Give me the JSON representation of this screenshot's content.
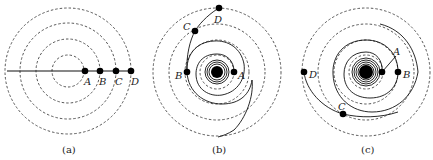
{
  "figure": {
    "panels": [
      {
        "id": "a",
        "caption": "(a)",
        "center": [
          68,
          71
        ],
        "dashed_radii": [
          16,
          32,
          48,
          63
        ],
        "points": [
          {
            "label": "A",
            "x": 85,
            "y": 71
          },
          {
            "label": "B",
            "x": 100,
            "y": 71
          },
          {
            "label": "C",
            "x": 116,
            "y": 71
          },
          {
            "label": "D",
            "x": 131,
            "y": 71
          }
        ]
      },
      {
        "id": "b",
        "caption": "(b)",
        "center": [
          217,
          72
        ],
        "dashed_radii": [
          17,
          32,
          48,
          64
        ],
        "points": [
          {
            "label": "A",
            "x": 234,
            "y": 72
          },
          {
            "label": "B",
            "x": 187,
            "y": 72
          },
          {
            "label": "C",
            "x": 195,
            "y": 31
          },
          {
            "label": "D",
            "x": 219,
            "y": 8
          }
        ]
      },
      {
        "id": "c",
        "caption": "(c)",
        "center": [
          366,
          72
        ],
        "dashed_radii": [
          17,
          32,
          48,
          64
        ],
        "points": [
          {
            "label": "A",
            "x": 382,
            "y": 72
          },
          {
            "label": "B",
            "x": 398,
            "y": 72
          },
          {
            "label": "C",
            "x": 343,
            "y": 114
          },
          {
            "label": "D",
            "x": 304,
            "y": 72
          }
        ]
      }
    ]
  }
}
